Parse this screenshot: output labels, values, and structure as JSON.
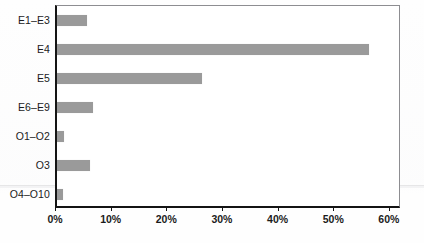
{
  "chart_data": {
    "type": "bar",
    "orientation": "horizontal",
    "title": "",
    "subtitle": "",
    "xlabel": "",
    "ylabel": "",
    "categories": [
      "E1–E3",
      "E4",
      "E5",
      "E6–E9",
      "O1–O2",
      "O3",
      "O4–O10"
    ],
    "values": [
      5.4,
      56.0,
      26.0,
      6.4,
      1.3,
      6.0,
      1.0
    ],
    "value_suffix": "%",
    "xlim": [
      0,
      62
    ],
    "xticks": [
      0,
      10,
      20,
      30,
      40,
      50,
      60
    ],
    "xtick_labels": [
      "0%",
      "10%",
      "20%",
      "30%",
      "40%",
      "50%",
      "60%"
    ],
    "grid": false,
    "legend": null,
    "legend_position": "none",
    "annotations": [],
    "series": [
      {
        "name": "percentage",
        "values": [
          5.4,
          56.0,
          26.0,
          6.4,
          1.3,
          6.0,
          1.0
        ]
      }
    ]
  },
  "style": {
    "bar_color": "#9a9a9a",
    "axis_color": "#141414",
    "frame_color": "#8d8d91",
    "text_color": "#1b1b1b",
    "background": "#ffffff"
  }
}
